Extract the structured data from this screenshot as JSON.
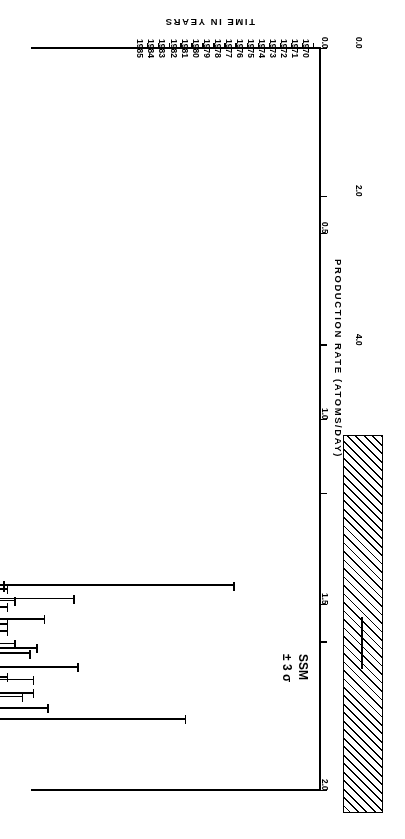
{
  "figure": {
    "orientation_note": "rotated-180",
    "ink_color": "#000000",
    "background": "#ffffff"
  },
  "chart_data": {
    "type": "scatter",
    "title": "",
    "xlabel": "TIME IN YEARS",
    "ylabel": "PRODUCTION RATE (ATOMS/DAY)",
    "y2label": "SOLAR NEUTRINO UNITS",
    "xlim": [
      1969.4,
      1995.6
    ],
    "ylim": [
      0.0,
      2.0
    ],
    "y2lim": [
      0.0,
      10.0
    ],
    "grid": false,
    "legend": "none",
    "xticks": [
      1970,
      1971,
      1972,
      1973,
      1974,
      1975,
      1976,
      1977,
      1978,
      1979,
      1980,
      1981,
      1982,
      1983,
      1984,
      1985
    ],
    "xticklabels": [
      "1970",
      "1971",
      "1972",
      "1973",
      "1974",
      "1975",
      "1976",
      "1977",
      "1978",
      "1979",
      "1980",
      "1981",
      "1982",
      "1983",
      "1984",
      "1985"
    ],
    "yticks": [
      0.0,
      0.5,
      1.0,
      1.5,
      2.0
    ],
    "yticklabels": [
      "0.0",
      "0.5",
      "1.0",
      "1.5",
      "2.0"
    ],
    "y2ticks": [
      0.0,
      2.0,
      4.0,
      6.0,
      8.0,
      10.0
    ],
    "y2ticklabels": [
      "0.0",
      "2.0",
      "4.0",
      "6.0",
      "8.0",
      "10.0"
    ],
    "error_kind": "symmetric-error-bars",
    "point_label_key": "run number",
    "annotations": [
      {
        "name": "ssm-band",
        "text": "SSM\n± 3 σ",
        "line1": "SSM",
        "line2": "± 3 σ",
        "center_snu": 8.0,
        "low_snu": 5.2,
        "high_snu": 10.3
      },
      {
        "name": "combined-point",
        "text": "COMBINED",
        "snu": 2.5,
        "rate": 0.5,
        "err": 0.04
      }
    ],
    "series": [
      {
        "name": "Homestake chlorine runs",
        "points": [
          {
            "run": "18",
            "x": 1970.3,
            "y": 0.2,
            "err": 0.35
          },
          {
            "run": "19",
            "x": 1970.72,
            "y": 0.48,
            "err": 0.42
          },
          {
            "run": "20",
            "x": 1971.0,
            "y": 0.33,
            "err": 0.33
          },
          {
            "run": "21",
            "x": 1971.22,
            "y": 0.4,
            "err": 0.3
          },
          {
            "run": "22",
            "x": 1971.45,
            "y": 0.45,
            "err": 0.22
          },
          {
            "run": "24",
            "x": 1972.1,
            "y": 0.52,
            "err": 0.5
          },
          {
            "run": "27",
            "x": 1972.58,
            "y": 1.02,
            "err": 0.52
          },
          {
            "run": "28",
            "x": 1972.86,
            "y": 0.05,
            "err": 0.1
          },
          {
            "run": "29",
            "x": 1973.1,
            "y": 0.38,
            "err": 0.38
          },
          {
            "run": "30",
            "x": 1973.32,
            "y": 0.55,
            "err": 0.35
          },
          {
            "run": "31",
            "x": 1973.6,
            "y": 0.72,
            "err": 0.45
          },
          {
            "run": "32",
            "x": 1973.86,
            "y": 0.28,
            "err": 0.3
          },
          {
            "run": "33",
            "x": 1974.06,
            "y": 0.46,
            "err": 0.36
          },
          {
            "run": "35",
            "x": 1974.22,
            "y": 0.12,
            "err": 0.18
          },
          {
            "run": "36",
            "x": 1974.62,
            "y": 0.8,
            "err": 0.3
          },
          {
            "run": "37",
            "x": 1974.94,
            "y": 0.88,
            "err": 0.25
          },
          {
            "run": "38",
            "x": 1975.28,
            "y": 0.52,
            "err": 0.32
          },
          {
            "run": "39",
            "x": 1975.72,
            "y": 0.62,
            "err": 0.4
          },
          {
            "run": "40",
            "x": 1975.96,
            "y": 0.42,
            "err": 0.38
          },
          {
            "run": "41",
            "x": 1976.06,
            "y": 0.6,
            "err": 0.42
          },
          {
            "run": "42",
            "x": 1976.16,
            "y": 0.78,
            "err": 0.35
          },
          {
            "run": "43",
            "x": 1976.26,
            "y": 0.3,
            "err": 0.28
          },
          {
            "run": "44",
            "x": 1976.38,
            "y": 0.66,
            "err": 0.4
          },
          {
            "run": "45",
            "x": 1976.5,
            "y": 0.26,
            "err": 0.22
          },
          {
            "run": "46",
            "x": 1976.66,
            "y": 0.58,
            "err": 0.45
          },
          {
            "run": "47",
            "x": 1976.8,
            "y": 0.7,
            "err": 0.3
          },
          {
            "run": "48",
            "x": 1977.0,
            "y": 0.48,
            "err": 0.34
          },
          {
            "run": "49",
            "x": 1977.3,
            "y": 0.95,
            "err": 0.3
          },
          {
            "run": "50",
            "x": 1977.62,
            "y": 0.55,
            "err": 0.32
          },
          {
            "run": "51",
            "x": 1977.8,
            "y": 0.6,
            "err": 0.4
          },
          {
            "run": "52",
            "x": 1978.02,
            "y": 0.4,
            "err": 0.28
          },
          {
            "run": "53",
            "x": 1978.3,
            "y": 0.34,
            "err": 0.34
          },
          {
            "run": "54",
            "x": 1978.52,
            "y": 0.72,
            "err": 0.4
          },
          {
            "run": "55",
            "x": 1978.78,
            "y": 0.58,
            "err": 0.38
          },
          {
            "run": "56",
            "x": 1979.0,
            "y": 0.8,
            "err": 0.34
          },
          {
            "run": "57",
            "x": 1979.2,
            "y": 0.25,
            "err": 0.3
          },
          {
            "run": "58",
            "x": 1979.4,
            "y": 0.66,
            "err": 0.42
          },
          {
            "run": "59",
            "x": 1979.56,
            "y": 0.36,
            "err": 0.3
          },
          {
            "run": "60",
            "x": 1979.76,
            "y": 0.62,
            "err": 0.28
          },
          {
            "run": "61",
            "x": 1979.96,
            "y": 0.44,
            "err": 0.3
          },
          {
            "run": "62",
            "x": 1980.14,
            "y": 0.56,
            "err": 0.34
          },
          {
            "run": "63",
            "x": 1980.28,
            "y": 0.3,
            "err": 0.26
          },
          {
            "run": "64",
            "x": 1980.4,
            "y": 0.52,
            "err": 0.34
          },
          {
            "run": "65",
            "x": 1980.52,
            "y": 0.7,
            "err": 0.36
          },
          {
            "run": "66",
            "x": 1980.64,
            "y": 0.46,
            "err": 0.32
          },
          {
            "run": "67",
            "x": 1980.76,
            "y": 0.64,
            "err": 0.38
          },
          {
            "run": "68",
            "x": 1980.96,
            "y": 0.5,
            "err": 0.34
          },
          {
            "run": "69",
            "x": 1981.16,
            "y": 0.74,
            "err": 0.32
          },
          {
            "run": "70",
            "x": 1981.34,
            "y": 0.28,
            "err": 0.26
          },
          {
            "run": "71",
            "x": 1981.64,
            "y": 0.9,
            "err": 0.26
          },
          {
            "run": "72",
            "x": 1981.92,
            "y": 0.62,
            "err": 0.36
          },
          {
            "run": "73",
            "x": 1982.14,
            "y": 0.22,
            "err": 0.22
          },
          {
            "run": "74",
            "x": 1982.38,
            "y": 0.52,
            "err": 0.36
          },
          {
            "run": "75",
            "x": 1982.7,
            "y": 0.66,
            "err": 0.4
          },
          {
            "run": "76",
            "x": 1982.94,
            "y": 0.36,
            "err": 0.34
          },
          {
            "run": "77",
            "x": 1983.14,
            "y": 0.44,
            "err": 0.36
          },
          {
            "run": "78",
            "x": 1983.3,
            "y": 0.74,
            "err": 0.34
          },
          {
            "run": "79",
            "x": 1983.46,
            "y": 0.8,
            "err": 0.44
          },
          {
            "run": "80",
            "x": 1983.62,
            "y": 0.58,
            "err": 0.38
          },
          {
            "run": "81",
            "x": 1983.8,
            "y": 0.28,
            "err": 0.3
          },
          {
            "run": "82",
            "x": 1984.0,
            "y": 0.5,
            "err": 0.38
          },
          {
            "run": "83",
            "x": 1984.18,
            "y": 0.22,
            "err": 0.24
          },
          {
            "run": "84",
            "x": 1984.34,
            "y": 0.64,
            "err": 0.42
          },
          {
            "run": "85",
            "x": 1984.5,
            "y": 0.54,
            "err": 0.36
          },
          {
            "run": "86",
            "x": 1984.66,
            "y": 1.05,
            "err": 0.62
          },
          {
            "run": "87",
            "x": 1984.92,
            "y": 0.18,
            "err": 0.3
          },
          {
            "run": "88",
            "x": 1985.1,
            "y": 0.42,
            "err": 0.34
          }
        ]
      }
    ]
  }
}
